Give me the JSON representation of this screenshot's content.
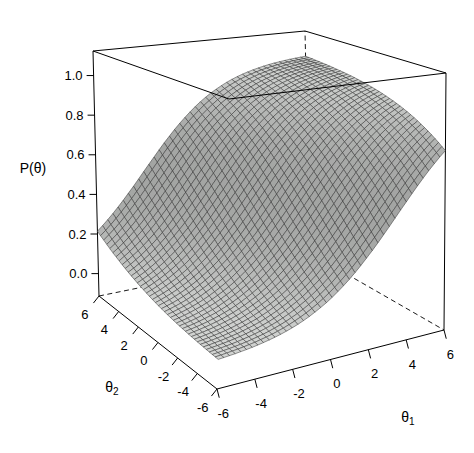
{
  "figure": {
    "width": 474,
    "height": 453,
    "background": "#ffffff"
  },
  "chart_data": {
    "type": "surface_3d",
    "zlabel": "P(θ)",
    "xlabel": "θ1",
    "ylabel": "θ2",
    "model": "P(θ) = 1 / (1 + exp(-(d + a1*θ1 + a2*θ2)))",
    "params": {
      "a1": 0.45,
      "a2": 0.25,
      "d": -0.1
    },
    "grid": {
      "min": -6,
      "max": 6,
      "facets": 40
    },
    "surface_corner_values": {
      "P_at_th1_-6_th2_-6": 0.013,
      "P_at_th1_6_th2_-6": 0.75,
      "P_at_th1_-6_th2_6": 0.21,
      "P_at_th1_6_th2_6": 0.98
    },
    "x_ticks": {
      "values": [
        -6,
        -4,
        -2,
        0,
        2,
        4,
        6
      ],
      "labels": [
        "-6",
        "-4",
        "-2",
        "0",
        "2",
        "4",
        "6"
      ]
    },
    "y_ticks": {
      "values": [
        6,
        4,
        2,
        0,
        -2,
        -4,
        -6
      ],
      "labels": [
        "6",
        "4",
        "2",
        "0",
        "-2",
        "-4",
        "-6"
      ]
    },
    "z_ticks": {
      "values": [
        0.0,
        0.2,
        0.4,
        0.6,
        0.8,
        1.0
      ],
      "labels": [
        "0.0",
        "0.2",
        "0.4",
        "0.6",
        "0.8",
        "1.0"
      ]
    },
    "zlim": [
      -0.113,
      1.124
    ],
    "xlim": [
      -6,
      6
    ],
    "ylim": [
      -6,
      6
    ],
    "legend": "none",
    "grid_on": false,
    "view": {
      "bottom_quad": {
        "F": [
          217,
          389
        ],
        "R": [
          444,
          330
        ],
        "L": [
          99,
          296
        ],
        "B": [
          310,
          253
        ]
      },
      "top_quad": {
        "TF": [
          229,
          99
        ],
        "TR": [
          446,
          73
        ],
        "TL": [
          93,
          51
        ],
        "TB": [
          305,
          31
        ]
      },
      "tick_len_xy": 9,
      "tick_len_z": 7,
      "label_offset_x_axis": 25,
      "label_offset_y_axis": 23,
      "shade_base": 0.42,
      "shade_span": 0.58,
      "slope_visual_scale": 10
    },
    "style": {
      "surface_fill": "#d2d4d2",
      "mesh_line": "#2e2e2e",
      "box_line": "#000000",
      "dash_pattern": "5 3.5",
      "text_color": "#000000",
      "tick_font_px": 13,
      "axis_label_font_px": 14,
      "subscript_font_px": 10
    }
  },
  "labels": {
    "z_axis": "P(θ)",
    "x_axis_base": "θ",
    "x_axis_sub": "1",
    "y_axis_base": "θ",
    "y_axis_sub": "2",
    "z_axis_pos": [
      33,
      168
    ],
    "x_axis_pos": [
      408,
      417
    ],
    "y_axis_pos": [
      112,
      387
    ]
  }
}
